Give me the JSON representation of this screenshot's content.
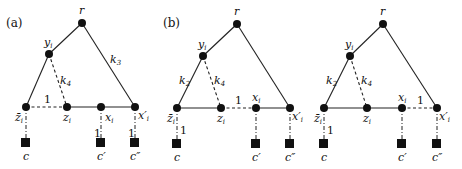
{
  "panels": [
    {
      "id": "a",
      "label": "(a)",
      "labels": {
        "r": "r",
        "y": "y",
        "y_sub": "i",
        "zbar": "z̄",
        "zbar_sub": "i",
        "z": "z",
        "z_sub": "i",
        "x": "x",
        "x_sub": "i",
        "xp": "x′",
        "xp_sub": "i",
        "c": "c",
        "cp": "c′",
        "cpp": "c″"
      },
      "edge_labels": {
        "k3": "k",
        "k3_sub": "3",
        "k4": "k",
        "k4_sub": "4",
        "one_top": "1",
        "one_xi": "1",
        "one_xp": "1"
      }
    },
    {
      "id": "b",
      "label": "(b)",
      "labels": {
        "r": "r",
        "y": "y",
        "y_sub": "i",
        "zbar": "z̄",
        "zbar_sub": "i",
        "z": "z",
        "z_sub": "i",
        "x": "x",
        "x_sub": "i",
        "xp": "x′",
        "xp_sub": "i",
        "c": "c",
        "cp": "c′",
        "cpp": "c″"
      },
      "edge_labels": {
        "k2": "k",
        "k2_sub": "2",
        "k4": "k",
        "k4_sub": "4",
        "one_top": "1",
        "one_c": "1"
      }
    },
    {
      "id": "c",
      "label": "",
      "labels": {
        "r": "r",
        "y": "y",
        "y_sub": "i",
        "zbar": "z̄",
        "zbar_sub": "i",
        "z": "z",
        "z_sub": "i",
        "x": "x",
        "x_sub": "i",
        "xp": "x′",
        "xp_sub": "i",
        "c": "c",
        "cp": "c′",
        "cpp": "c″"
      },
      "edge_labels": {
        "k2": "k",
        "k2_sub": "2",
        "k4": "k",
        "k4_sub": "4",
        "one_top": "1",
        "one_c": "1"
      }
    }
  ]
}
